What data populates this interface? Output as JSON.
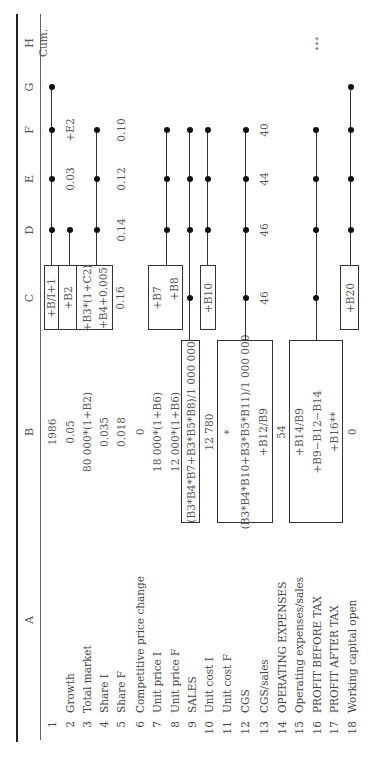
{
  "columns": [
    {
      "letter": "A",
      "x": 149
    },
    {
      "letter": "B",
      "x": 337
    },
    {
      "letter": "C",
      "x": 471
    },
    {
      "letter": "D",
      "x": 539
    },
    {
      "letter": "E",
      "x": 590
    },
    {
      "letter": "F",
      "x": 639
    },
    {
      "letter": "G",
      "x": 682
    },
    {
      "letter": "H",
      "x": 726
    }
  ],
  "rows": [
    {
      "n": "1",
      "label": "",
      "y": 52
    },
    {
      "n": "2",
      "label": "Growth",
      "y": 70
    },
    {
      "n": "3",
      "label": "Total market",
      "y": 87
    },
    {
      "n": "4",
      "label": "Share I",
      "y": 104
    },
    {
      "n": "5",
      "label": "Share F",
      "y": 121
    },
    {
      "n": "6",
      "label": "Competitive price change",
      "y": 140
    },
    {
      "n": "7",
      "label": "Unit price I",
      "y": 157
    },
    {
      "n": "8",
      "label": "Unit price F",
      "y": 175
    },
    {
      "n": "9",
      "label": "SALES",
      "y": 192
    },
    {
      "n": "10",
      "label": "Unit cost I",
      "y": 209
    },
    {
      "n": "11",
      "label": "Unit cost F",
      "y": 227
    },
    {
      "n": "12",
      "label": "CGS",
      "y": 245
    },
    {
      "n": "13",
      "label": "CGS/sales",
      "y": 264
    },
    {
      "n": "14",
      "label": "OPERATING EXPENSES",
      "y": 282
    },
    {
      "n": "15",
      "label": "Operating expenses/sales",
      "y": 299
    },
    {
      "n": "16",
      "label": "PROFIT BEFORE TAX",
      "y": 317
    },
    {
      "n": "17",
      "label": "PROFIT AFTER TAX",
      "y": 334
    },
    {
      "n": "18",
      "label": "Working capital open",
      "y": 352
    }
  ],
  "cells": {
    "B1": "1986",
    "B2": "0.05",
    "B3": "80 000*(1+B2)",
    "B4": "0.035",
    "B5": "0.018",
    "B6": "0",
    "B7": "18 000*(1+B6)",
    "B8": "12 000*(1+B6)",
    "B9": "(B3*B4*B7+B3*B5*B8)/1 000 000",
    "B10": "12 780",
    "B11": "*",
    "B12": "(B3*B4*B10+B3*B5*B11)/1 000 000",
    "B13": "+B12/B9",
    "B14": "54",
    "B15": "+B14/B9",
    "B16": "+B9−B12−B14",
    "B17": "+B16**",
    "B18": "0",
    "C1": "+B/I+1",
    "C2": "+B2",
    "C3": "+B3*(1+C2)",
    "C4": "+B4+0.005",
    "C5": "0.16",
    "C7": "+B7",
    "C8": "+B8",
    "C10": "+B10",
    "C13": "46",
    "C18": "+B20",
    "D5": "0.14",
    "D13": "46",
    "E2": "0.03",
    "E5": "0.12",
    "E13": "44",
    "F2": "+E2",
    "F5": "0.10",
    "F13": "40",
    "H1": "Cum.",
    "H17": "***"
  }
}
